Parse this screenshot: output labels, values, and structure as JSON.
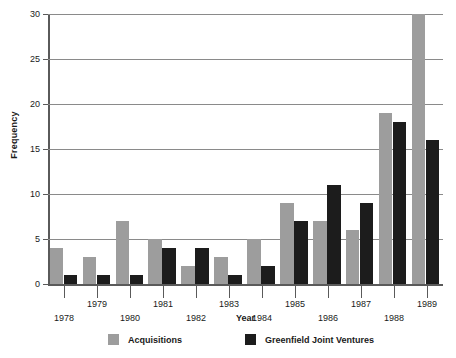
{
  "chart_data": {
    "type": "bar",
    "title": "",
    "xlabel": "Year",
    "ylabel": "Frequency",
    "categories": [
      "1978",
      "1979",
      "1980",
      "1981",
      "1982",
      "1983",
      "1984",
      "1985",
      "1986",
      "1987",
      "1988",
      "1989"
    ],
    "series": [
      {
        "name": "Acquisitions",
        "color": "#9d9d9d",
        "values": [
          4,
          3,
          7,
          5,
          2,
          3,
          5,
          9,
          7,
          6,
          19,
          30
        ]
      },
      {
        "name": "Greenfield Joint Ventures",
        "color": "#1c1c1c",
        "values": [
          1,
          1,
          1,
          4,
          4,
          1,
          2,
          7,
          11,
          9,
          18,
          16
        ]
      }
    ],
    "ylim": [
      0,
      30
    ],
    "yticks": [
      0,
      5,
      10,
      15,
      20,
      25,
      30
    ],
    "ytick_labels": [
      "0",
      "5",
      "10",
      "15",
      "20",
      "25",
      "30"
    ],
    "grid": true,
    "grid_axis": "y",
    "legend_position": "bottom",
    "xtick_label_rows": {
      "upper": [
        "1979",
        "1981",
        "1983",
        "1985",
        "1987",
        "1989"
      ],
      "lower": [
        "1978",
        "1980",
        "1982",
        "1984",
        "1986",
        "1988"
      ]
    }
  },
  "axes": {
    "y_title": "Frequency",
    "x_title": "Year",
    "y_ticks": [
      {
        "label": "30",
        "value": 30
      },
      {
        "label": "25",
        "value": 25
      },
      {
        "label": "20",
        "value": 20
      },
      {
        "label": "15",
        "value": 15
      },
      {
        "label": "10",
        "value": 10
      },
      {
        "label": "5",
        "value": 5
      },
      {
        "label": "0",
        "value": 0
      }
    ],
    "x_ticks": [
      {
        "label": "1978",
        "row": "lower"
      },
      {
        "label": "1979",
        "row": "upper"
      },
      {
        "label": "1980",
        "row": "lower"
      },
      {
        "label": "1981",
        "row": "upper"
      },
      {
        "label": "1982",
        "row": "lower"
      },
      {
        "label": "1983",
        "row": "upper"
      },
      {
        "label": "1984",
        "row": "lower"
      },
      {
        "label": "1985",
        "row": "upper"
      },
      {
        "label": "1986",
        "row": "lower"
      },
      {
        "label": "1987",
        "row": "upper"
      },
      {
        "label": "1988",
        "row": "lower"
      },
      {
        "label": "1989",
        "row": "upper"
      }
    ]
  },
  "legend": {
    "items": [
      {
        "label": "Acquisitions",
        "color": "#9d9d9d"
      },
      {
        "label": "Greenfield Joint Ventures",
        "color": "#1c1c1c"
      }
    ]
  },
  "colors": {
    "acquisitions": "#9d9d9d",
    "greenfield": "#1c1c1c",
    "axis": "#5a5a5a",
    "gridline": "#8a8a8a",
    "text": "#1a1a1a",
    "background": "#ffffff"
  }
}
